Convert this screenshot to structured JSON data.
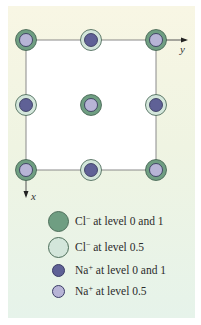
{
  "diagram": {
    "axes": {
      "x_label": "x",
      "y_label": "y"
    },
    "colors": {
      "background_top": "#f8f6e4",
      "background_bottom": "#e6f3ea",
      "square_fill": "#ffffff",
      "line": "#8a8a8a",
      "cl_level_0_1": "#6f9e82",
      "cl_level_0_5": "#d3e6db",
      "na_level_0_1": "#5f6196",
      "na_level_0_5": "#b7b4d6"
    },
    "grid": {
      "columns_x": [
        26,
        91,
        156
      ],
      "rows_y": [
        40,
        105,
        170
      ]
    },
    "sites": [
      {
        "row": 0,
        "col": 0,
        "outer": "cl_level_0_1",
        "inner": "na_level_0_5"
      },
      {
        "row": 0,
        "col": 1,
        "outer": "cl_level_0_5",
        "inner": "na_level_0_1"
      },
      {
        "row": 0,
        "col": 2,
        "outer": "cl_level_0_1",
        "inner": "na_level_0_5"
      },
      {
        "row": 1,
        "col": 0,
        "outer": "cl_level_0_5",
        "inner": "na_level_0_1"
      },
      {
        "row": 1,
        "col": 1,
        "outer": "cl_level_0_1",
        "inner": "na_level_0_5"
      },
      {
        "row": 1,
        "col": 2,
        "outer": "cl_level_0_5",
        "inner": "na_level_0_1"
      },
      {
        "row": 2,
        "col": 0,
        "outer": "cl_level_0_1",
        "inner": "na_level_0_5"
      },
      {
        "row": 2,
        "col": 1,
        "outer": "cl_level_0_5",
        "inner": "na_level_0_1"
      },
      {
        "row": 2,
        "col": 2,
        "outer": "cl_level_0_1",
        "inner": "na_level_0_5"
      }
    ]
  },
  "legend": {
    "items": [
      {
        "ion": "Cl",
        "charge": "−",
        "text": " at level 0 and 1",
        "swatch": "cl_level_0_1"
      },
      {
        "ion": "Cl",
        "charge": "−",
        "text": " at level 0.5",
        "swatch": "cl_level_0_5"
      },
      {
        "ion": "Na",
        "charge": "+",
        "text": " at level 0 and 1",
        "swatch": "na_level_0_1"
      },
      {
        "ion": "Na",
        "charge": "+",
        "text": " at level 0.5",
        "swatch": "na_level_0_5"
      }
    ]
  }
}
